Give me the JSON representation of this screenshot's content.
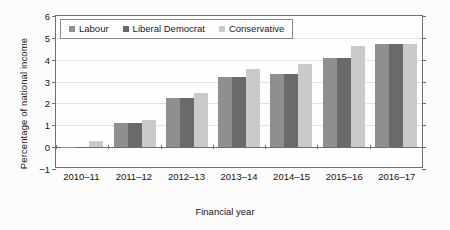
{
  "chart_data": {
    "type": "bar",
    "title": "",
    "xlabel": "Financial year",
    "ylabel": "Percentage of national income",
    "categories": [
      "2010–11",
      "2011–12",
      "2012–13",
      "2013–14",
      "2014–15",
      "2015–16",
      "2016–17"
    ],
    "series": [
      {
        "name": "Labour",
        "color": "#8f8f8f",
        "values": [
          -0.05,
          1.12,
          2.25,
          3.2,
          3.36,
          4.06,
          4.74
        ]
      },
      {
        "name": "Liberal Democrat",
        "color": "#6a6a6a",
        "values": [
          -0.05,
          1.12,
          2.25,
          3.2,
          3.36,
          4.06,
          4.74
        ]
      },
      {
        "name": "Conservative",
        "color": "#cacaca",
        "values": [
          0.28,
          1.22,
          2.48,
          3.56,
          3.82,
          4.64,
          4.72
        ]
      }
    ],
    "ylim": [
      -1,
      6
    ],
    "yticks": [
      6,
      5,
      4,
      3,
      2,
      1,
      0,
      -1
    ],
    "ytick_labels": [
      "6",
      "5",
      "4",
      "3",
      "2",
      "1",
      "0",
      "−1"
    ],
    "grid": true,
    "legend_position": "top-left"
  }
}
